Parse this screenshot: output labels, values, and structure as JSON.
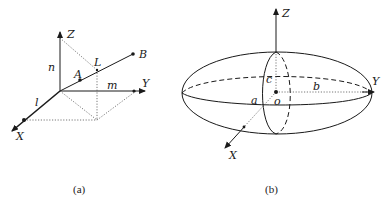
{
  "figure_a": {
    "caption": "(a)",
    "axes": {
      "x": "X",
      "y": "Y",
      "z": "Z"
    },
    "points": {
      "a": "A",
      "b": "B",
      "l_upper": "L"
    },
    "segment_labels": {
      "l": "l",
      "m": "m",
      "n": "n"
    }
  },
  "figure_b": {
    "caption": "(b)",
    "axes": {
      "x": "X",
      "y": "Y",
      "z": "Z"
    },
    "semi_axes": {
      "a": "a",
      "b": "b",
      "c": "c"
    },
    "origin": "o"
  },
  "colors": {
    "ink": "#1a1a1a",
    "background": "#ffffff"
  }
}
